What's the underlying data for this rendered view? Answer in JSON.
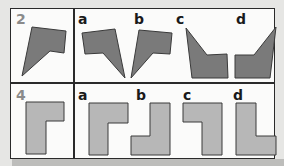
{
  "rows": [
    {
      "number": "2",
      "shape_color": "#7a7a7a",
      "options": [
        {
          "label": "a"
        },
        {
          "label": "b"
        },
        {
          "label": "c"
        },
        {
          "label": "d"
        }
      ]
    },
    {
      "number": "4",
      "shape_color": "#b7b7b7",
      "options": [
        {
          "label": "a"
        },
        {
          "label": "b"
        },
        {
          "label": "c"
        },
        {
          "label": "d"
        }
      ]
    }
  ],
  "colors": {
    "background": "#e6e6e4",
    "panel": "#fbfbfa",
    "border": "#2a2a2a",
    "number": "#8a8a8a",
    "dark_shape": "#7a7a7a",
    "light_shape": "#b7b7b7"
  }
}
